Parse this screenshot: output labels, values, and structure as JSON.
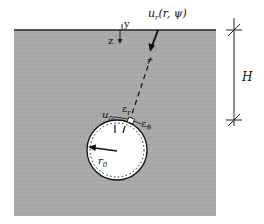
{
  "diagram": {
    "colors": {
      "ground_fill": "#a9a9a9",
      "surface_line": "#222222",
      "tunnel_fill": "#ffffff",
      "ink": "#111111",
      "background": "#ffffff"
    },
    "labels": {
      "y_axis": "y",
      "z_axis": "z",
      "displacement_main": "u",
      "displacement_sub": "r",
      "displacement_args": "(r, ψ)",
      "radial_coord": "r",
      "u_label": "u",
      "u_sub": "0i",
      "eps_r": "ε",
      "eps_r_sub": "r",
      "eps_theta": "ε",
      "eps_theta_sub": "ϑ",
      "radius": "r",
      "radius_sub": "0",
      "depth": "H"
    }
  }
}
